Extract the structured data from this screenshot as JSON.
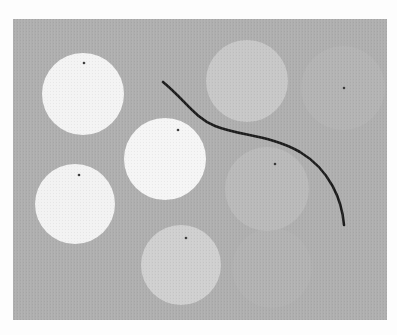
{
  "scene": {
    "background_color": "#fdfdfd",
    "panel": {
      "x": 13,
      "y": 19,
      "width": 374,
      "height": 301,
      "color": "#aeaeae"
    },
    "circles": [
      {
        "id": "c1",
        "cx": 83,
        "cy": 94,
        "r": 41,
        "fill": "#f3f3f3",
        "dot": {
          "x": 84,
          "y": 63
        }
      },
      {
        "id": "c2",
        "cx": 165,
        "cy": 159,
        "r": 41,
        "fill": "#f5f5f5",
        "dot": {
          "x": 178,
          "y": 130
        }
      },
      {
        "id": "c3",
        "cx": 75,
        "cy": 204,
        "r": 40,
        "fill": "#f2f2f2",
        "dot": {
          "x": 79,
          "y": 175
        }
      },
      {
        "id": "c4",
        "cx": 181,
        "cy": 265,
        "r": 40,
        "fill": "#cfcfcf",
        "dot": {
          "x": 186,
          "y": 238
        }
      },
      {
        "id": "c5",
        "cx": 247,
        "cy": 81,
        "r": 41,
        "fill": "#c7c7c7",
        "dot": null
      },
      {
        "id": "c6",
        "cx": 267,
        "cy": 189,
        "r": 42,
        "fill": "#b9b9b9",
        "dot": {
          "x": 275,
          "y": 164
        }
      },
      {
        "id": "c7",
        "cx": 343,
        "cy": 88,
        "r": 42,
        "fill": "#b3b3b3",
        "dot": {
          "x": 344,
          "y": 88
        }
      },
      {
        "id": "c8",
        "cx": 272,
        "cy": 268,
        "r": 40,
        "fill": "#b1b1b1",
        "dot": null
      }
    ],
    "dot_color": "#3a3a3a",
    "dot_radius": 1.3,
    "curve": {
      "path": "M163,82 C185,100 195,118 215,126 C240,136 270,135 300,152 C330,170 342,200 344,225",
      "stroke": "#1c1c1c",
      "width": 2.6
    }
  }
}
